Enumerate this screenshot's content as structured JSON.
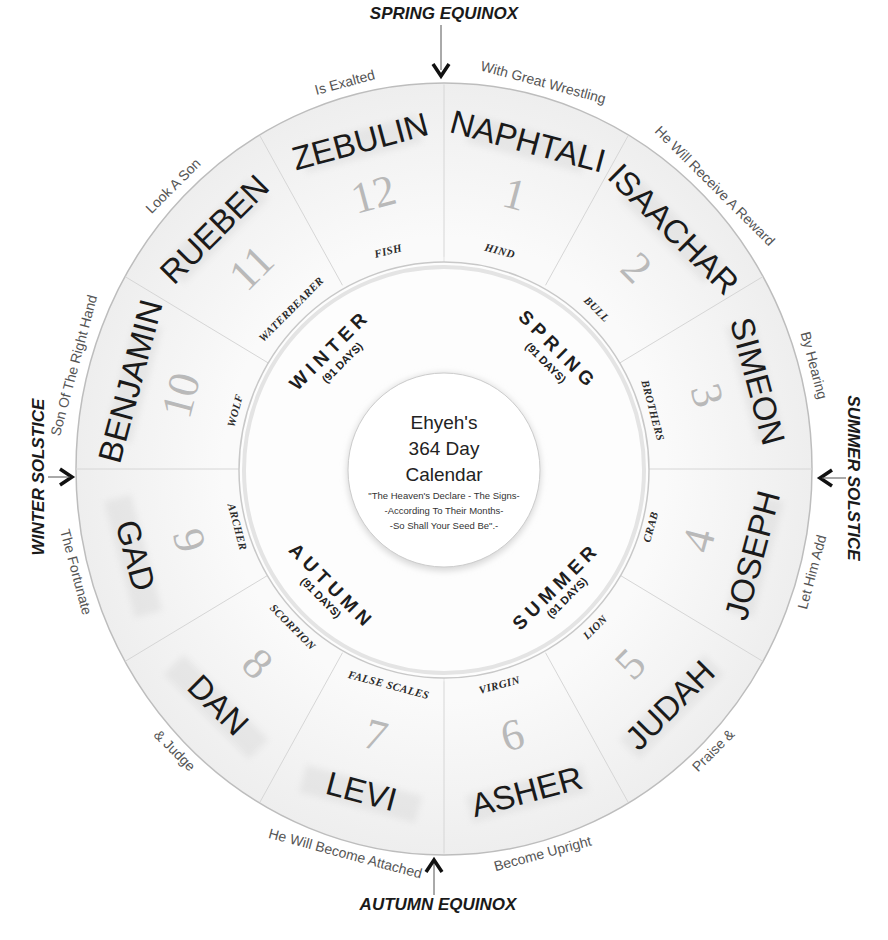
{
  "center": {
    "title_lines": [
      "Ehyeh's",
      "364 Day",
      "Calendar"
    ],
    "quote_lines": [
      "\"The Heaven's Declare - The Signs-",
      "-According To Their Months-",
      "-So Shall Your Seed Be\".-"
    ]
  },
  "months": [
    {
      "number": "1",
      "tribe": "NAPHTALI",
      "blessing": "With Great Wrestling",
      "sign": "HIND"
    },
    {
      "number": "2",
      "tribe": "ISAACHAR",
      "blessing": "He Will Receive A Reward",
      "sign": "BULL"
    },
    {
      "number": "3",
      "tribe": "SIMEON",
      "blessing": "By Hearing",
      "sign": "BROTHERS"
    },
    {
      "number": "4",
      "tribe": "JOSEPH",
      "blessing": "Let Him Add",
      "sign": "CRAB"
    },
    {
      "number": "5",
      "tribe": "JUDAH",
      "blessing": "Praise &",
      "sign": "LION"
    },
    {
      "number": "6",
      "tribe": "ASHER",
      "blessing": "Become Upright",
      "sign": "VIRGIN"
    },
    {
      "number": "7",
      "tribe": "LEVI",
      "blessing": "He Will Become Attached",
      "sign": "FALSE SCALES"
    },
    {
      "number": "8",
      "tribe": "DAN",
      "blessing": "& Judge",
      "sign": "SCORPION"
    },
    {
      "number": "9",
      "tribe": "GAD",
      "blessing": "The Fortunate",
      "sign": "ARCHER"
    },
    {
      "number": "10",
      "tribe": "BENJAMIN",
      "blessing": "Son Of The Right Hand",
      "sign": "WOLF"
    },
    {
      "number": "11",
      "tribe": "RUEBEN",
      "blessing": "Look A Son",
      "sign": "WATERBEARER"
    },
    {
      "number": "12",
      "tribe": "ZEBULIN",
      "blessing": "Is Exalted",
      "sign": "FISH"
    }
  ],
  "seasons": [
    {
      "name": "SPRING",
      "days": "(91 DAYS)"
    },
    {
      "name": "SUMMER",
      "days": "(91 DAYS)"
    },
    {
      "name": "AUTUMN",
      "days": "(91 DAYS)"
    },
    {
      "name": "WINTER",
      "days": "(91 DAYS)"
    }
  ],
  "markers": {
    "spring_equinox": "SPRING  EQUINOX",
    "summer_solstice": "SUMMER SOLSTICE",
    "autumn_equinox": "AUTUMN EQUINOX",
    "winter_solstice": "WINTER SOLSTICE"
  },
  "colors": {
    "wheel_fill": "#f3f3f3",
    "ring_line": "#cfcfcf",
    "text_dark": "#1a1a1a"
  }
}
